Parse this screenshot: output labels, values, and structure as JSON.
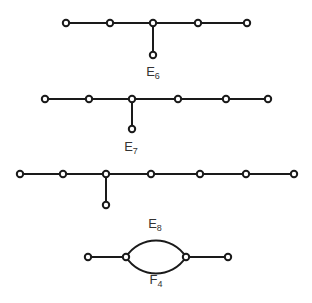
{
  "diagrams": [
    {
      "name": "E6",
      "letter": "E",
      "index": "6",
      "label_pos": [
        153,
        64
      ],
      "nodes": [
        [
          66,
          23
        ],
        [
          110,
          23
        ],
        [
          153,
          23
        ],
        [
          198,
          23
        ],
        [
          247,
          23
        ],
        [
          153,
          55
        ]
      ],
      "edges": [
        [
          0,
          1
        ],
        [
          1,
          2
        ],
        [
          2,
          3
        ],
        [
          3,
          4
        ],
        [
          2,
          5
        ]
      ]
    },
    {
      "name": "E7",
      "letter": "E",
      "index": "7",
      "label_pos": [
        131,
        139
      ],
      "nodes": [
        [
          45,
          99
        ],
        [
          89,
          99
        ],
        [
          132,
          99
        ],
        [
          178,
          99
        ],
        [
          226,
          99
        ],
        [
          268,
          99
        ],
        [
          132,
          129
        ]
      ],
      "edges": [
        [
          0,
          1
        ],
        [
          1,
          2
        ],
        [
          2,
          3
        ],
        [
          3,
          4
        ],
        [
          4,
          5
        ],
        [
          2,
          6
        ]
      ]
    },
    {
      "name": "E8",
      "letter": "E",
      "index": "8",
      "label_pos": [
        155,
        216
      ],
      "nodes": [
        [
          20,
          174
        ],
        [
          63,
          174
        ],
        [
          106,
          174
        ],
        [
          151,
          174
        ],
        [
          200,
          174
        ],
        [
          246,
          174
        ],
        [
          294,
          174
        ],
        [
          106,
          205
        ]
      ],
      "edges": [
        [
          0,
          1
        ],
        [
          1,
          2
        ],
        [
          2,
          3
        ],
        [
          3,
          4
        ],
        [
          4,
          5
        ],
        [
          5,
          6
        ],
        [
          2,
          7
        ]
      ]
    },
    {
      "name": "F4",
      "letter": "F",
      "index": "4",
      "label_pos": [
        156,
        272
      ],
      "nodes": [
        [
          88,
          257
        ],
        [
          126,
          257
        ],
        [
          186,
          257
        ],
        [
          228,
          257
        ]
      ],
      "edges": [
        [
          0,
          1
        ],
        [
          2,
          3
        ]
      ],
      "double_arcs": [
        [
          1,
          2
        ]
      ]
    }
  ],
  "colors": {
    "line": "#1a1a1a",
    "node_fill": "#ffffff"
  }
}
